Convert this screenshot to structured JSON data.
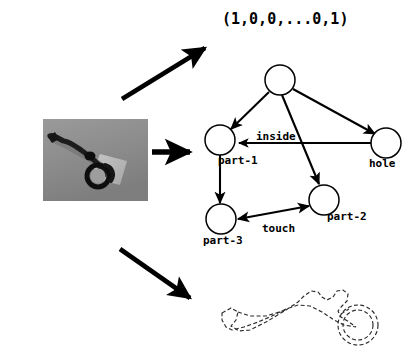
{
  "figure": {
    "background_color": "#ffffff",
    "ink_color": "#000000"
  },
  "feature_vector": {
    "text": "(1,0,0,...0,1)"
  },
  "source_image": {
    "name": "grayscale-tool-photograph",
    "alt": "Grayscale photograph of a dark hand tool on a gray background",
    "background_color": "#8c8c8c",
    "object_color": "#1a1a1a"
  },
  "contour_image": {
    "name": "dashed-tool-contour",
    "alt": "Dashed outline contour of the tool with concentric circles at the right end"
  },
  "arrows": [
    {
      "name": "arrow-to-feature-vector",
      "direction": "up-right"
    },
    {
      "name": "arrow-to-graph",
      "direction": "right"
    },
    {
      "name": "arrow-to-contour",
      "direction": "down-right"
    }
  ],
  "graph": {
    "nodes": [
      {
        "id": "root",
        "label": "",
        "cx": 280,
        "cy": 80,
        "r": 15
      },
      {
        "id": "part1",
        "label": "part-1",
        "cx": 220,
        "cy": 140,
        "r": 15
      },
      {
        "id": "hole",
        "label": "hole",
        "cx": 386,
        "cy": 143,
        "r": 15
      },
      {
        "id": "part2",
        "label": "part-2",
        "cx": 324,
        "cy": 200,
        "r": 15
      },
      {
        "id": "part3",
        "label": "part-3",
        "cx": 221,
        "cy": 219,
        "r": 15
      }
    ],
    "node_labels": [
      {
        "text": "part-1",
        "x": 218,
        "y": 155
      },
      {
        "text": "hole",
        "x": 369,
        "y": 158
      },
      {
        "text": "part-2",
        "x": 327,
        "y": 210
      },
      {
        "text": "part-3",
        "x": 203,
        "y": 235
      }
    ],
    "edges": [
      {
        "from": "root",
        "to": "part1",
        "label": ""
      },
      {
        "from": "root",
        "to": "hole",
        "label": ""
      },
      {
        "from": "root",
        "to": "part2",
        "label": ""
      },
      {
        "from": "hole",
        "to": "part1",
        "label": "inside"
      },
      {
        "from": "part1",
        "to": "part3",
        "label": ""
      },
      {
        "from": "part3",
        "to": "part2",
        "label": "touch"
      },
      {
        "from": "part2",
        "to": "part3",
        "label": "touch"
      }
    ],
    "edge_labels": [
      {
        "text": "inside",
        "x": 258,
        "y": 132
      },
      {
        "text": "touch",
        "x": 262,
        "y": 223
      }
    ]
  }
}
